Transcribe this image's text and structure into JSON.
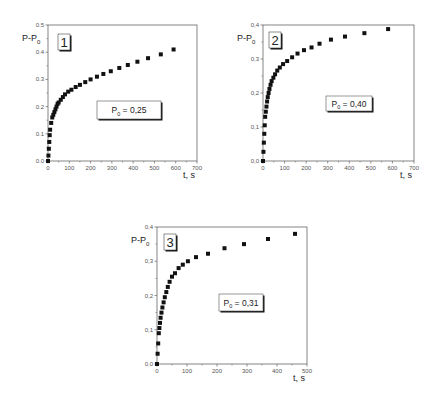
{
  "chart_data": [
    {
      "id": "panel-1",
      "type": "scatter",
      "panel_label": "1",
      "annotation": {
        "symbol": "P",
        "subscript": "0",
        "text": " = 0,25"
      },
      "xlabel": "t, s",
      "ylabel": {
        "main": "P-P",
        "subscript": "0"
      },
      "xlim": [
        0,
        700
      ],
      "ylim": [
        0.0,
        0.5
      ],
      "xticks": [
        "0",
        "100",
        "200",
        "300",
        "400",
        "500",
        "600",
        "700"
      ],
      "yticks": [
        "0.0",
        "0.1",
        "0.2",
        "0.3",
        "0.4",
        "0.5"
      ],
      "grid": false,
      "marker": "square",
      "x": [
        0,
        2,
        4,
        6,
        8,
        10,
        15,
        20,
        25,
        30,
        35,
        40,
        45,
        50,
        60,
        70,
        80,
        95,
        110,
        130,
        150,
        175,
        200,
        230,
        260,
        295,
        335,
        375,
        420,
        470,
        530,
        590
      ],
      "y": [
        0.0,
        0.02,
        0.045,
        0.07,
        0.095,
        0.115,
        0.14,
        0.16,
        0.17,
        0.18,
        0.19,
        0.2,
        0.21,
        0.215,
        0.225,
        0.235,
        0.245,
        0.255,
        0.262,
        0.272,
        0.28,
        0.29,
        0.3,
        0.31,
        0.32,
        0.33,
        0.342,
        0.353,
        0.365,
        0.378,
        0.392,
        0.41
      ]
    },
    {
      "id": "panel-2",
      "type": "scatter",
      "panel_label": "2",
      "annotation": {
        "symbol": "P",
        "subscript": "0",
        "text": " = 0,40"
      },
      "xlabel": "t, s",
      "ylabel": {
        "main": "P-P",
        "subscript": "0"
      },
      "xlim": [
        0,
        700
      ],
      "ylim": [
        0.0,
        0.4
      ],
      "xticks": [
        "0",
        "100",
        "200",
        "300",
        "400",
        "500",
        "600",
        "700"
      ],
      "yticks": [
        "0,0",
        "0,1",
        "0,2",
        "0,3",
        "0,4"
      ],
      "grid": false,
      "marker": "square",
      "x": [
        0,
        2,
        4,
        6,
        8,
        10,
        13,
        16,
        19,
        22,
        26,
        30,
        35,
        40,
        48,
        56,
        66,
        78,
        93,
        112,
        135,
        160,
        190,
        225,
        262,
        315,
        380,
        470,
        580
      ],
      "y": [
        0.0,
        0.027,
        0.054,
        0.08,
        0.105,
        0.13,
        0.145,
        0.16,
        0.175,
        0.188,
        0.2,
        0.212,
        0.224,
        0.235,
        0.245,
        0.255,
        0.266,
        0.275,
        0.285,
        0.294,
        0.305,
        0.316,
        0.326,
        0.334,
        0.345,
        0.357,
        0.366,
        0.376,
        0.388
      ]
    },
    {
      "id": "panel-3",
      "type": "scatter",
      "panel_label": "3",
      "annotation": {
        "symbol": "P",
        "subscript": "0",
        "text": " = 0,31"
      },
      "xlabel": "t, s",
      "ylabel": {
        "main": "P-P",
        "subscript": "0"
      },
      "xlim": [
        0,
        500
      ],
      "ylim": [
        0.0,
        0.4
      ],
      "xticks": [
        "0",
        "100",
        "200",
        "300",
        "400",
        "500"
      ],
      "yticks": [
        "0,0",
        "0,1",
        "0,2",
        "0,3",
        "0,4"
      ],
      "grid": false,
      "marker": "square",
      "x": [
        0,
        2,
        4,
        6,
        8,
        10,
        12,
        15,
        18,
        22,
        26,
        31,
        36,
        42,
        50,
        60,
        72,
        86,
        103,
        130,
        170,
        225,
        290,
        370,
        460
      ],
      "y": [
        0.0,
        0.03,
        0.06,
        0.09,
        0.105,
        0.12,
        0.135,
        0.15,
        0.165,
        0.18,
        0.195,
        0.21,
        0.225,
        0.24,
        0.255,
        0.265,
        0.28,
        0.29,
        0.3,
        0.312,
        0.322,
        0.338,
        0.35,
        0.365,
        0.38
      ]
    }
  ],
  "layout": {
    "panels": [
      {
        "x0": 48,
        "x1": 197,
        "y0": 161,
        "y1": 25,
        "box": {
          "x": 97,
          "y": 101,
          "w": 64,
          "h": 18
        },
        "num": {
          "x": 58,
          "y": 34
        }
      },
      {
        "x0": 263,
        "x1": 414,
        "y0": 161,
        "y1": 25,
        "box": {
          "x": 326,
          "y": 96,
          "w": 46,
          "h": 15
        },
        "num": {
          "x": 269,
          "y": 32
        }
      },
      {
        "x0": 157,
        "x1": 307,
        "y0": 364,
        "y1": 227,
        "box": {
          "x": 219,
          "y": 294,
          "w": 44,
          "h": 17
        },
        "num": {
          "x": 164,
          "y": 234
        }
      }
    ]
  }
}
